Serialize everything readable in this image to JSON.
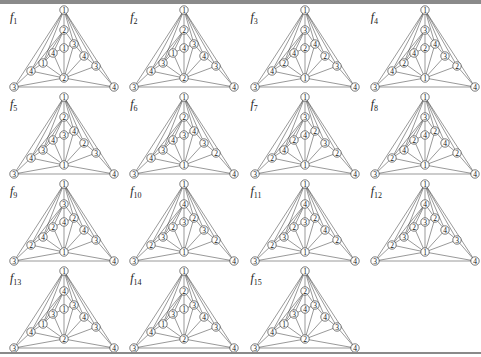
{
  "figure": {
    "node_order": [
      "apex",
      "top2",
      "center",
      "L1",
      "L2",
      "L3",
      "R1",
      "R2",
      "R3",
      "hub",
      "BL",
      "BR"
    ],
    "panels": [
      {
        "label": "f",
        "sub": "1",
        "colors": [
          1,
          2,
          1,
          4,
          1,
          4,
          3,
          4,
          3,
          2,
          3,
          4
        ]
      },
      {
        "label": "f",
        "sub": "2",
        "colors": [
          1,
          2,
          4,
          1,
          3,
          4,
          3,
          4,
          3,
          2,
          3,
          4
        ]
      },
      {
        "label": "f",
        "sub": "3",
        "colors": [
          1,
          3,
          2,
          4,
          2,
          4,
          4,
          2,
          3,
          1,
          3,
          4
        ]
      },
      {
        "label": "f",
        "sub": "4",
        "colors": [
          1,
          3,
          2,
          4,
          2,
          4,
          4,
          3,
          2,
          1,
          3,
          4
        ]
      },
      {
        "label": "f",
        "sub": "5",
        "colors": [
          1,
          2,
          3,
          4,
          3,
          4,
          4,
          2,
          3,
          1,
          3,
          4
        ]
      },
      {
        "label": "f",
        "sub": "6",
        "colors": [
          1,
          2,
          3,
          4,
          3,
          4,
          4,
          3,
          2,
          1,
          3,
          4
        ]
      },
      {
        "label": "f",
        "sub": "7",
        "colors": [
          1,
          3,
          4,
          2,
          4,
          2,
          2,
          3,
          2,
          1,
          3,
          4
        ]
      },
      {
        "label": "f",
        "sub": "8",
        "colors": [
          1,
          3,
          4,
          2,
          4,
          2,
          2,
          4,
          2,
          1,
          3,
          4
        ]
      },
      {
        "label": "f",
        "sub": "9",
        "colors": [
          1,
          3,
          4,
          2,
          4,
          2,
          2,
          4,
          3,
          1,
          3,
          4
        ]
      },
      {
        "label": "f",
        "sub": "10",
        "colors": [
          1,
          4,
          3,
          2,
          3,
          2,
          2,
          3,
          2,
          1,
          3,
          4
        ]
      },
      {
        "label": "f",
        "sub": "11",
        "colors": [
          1,
          4,
          3,
          2,
          3,
          2,
          2,
          4,
          2,
          1,
          3,
          4
        ]
      },
      {
        "label": "f",
        "sub": "12",
        "colors": [
          1,
          4,
          3,
          2,
          3,
          2,
          2,
          4,
          3,
          1,
          3,
          4
        ]
      },
      {
        "label": "f",
        "sub": "13",
        "colors": [
          1,
          4,
          1,
          3,
          1,
          4,
          3,
          4,
          3,
          2,
          3,
          4
        ]
      },
      {
        "label": "f",
        "sub": "14",
        "colors": [
          1,
          2,
          1,
          3,
          1,
          4,
          3,
          4,
          3,
          2,
          3,
          4
        ]
      },
      {
        "label": "f",
        "sub": "15",
        "colors": [
          1,
          2,
          4,
          3,
          1,
          4,
          3,
          4,
          3,
          2,
          3,
          4
        ]
      }
    ]
  },
  "colors": {
    "edge": "#333333",
    "node_fill": "#ffffff",
    "node_stroke": "#222222",
    "bar": "#8a8a8a"
  }
}
